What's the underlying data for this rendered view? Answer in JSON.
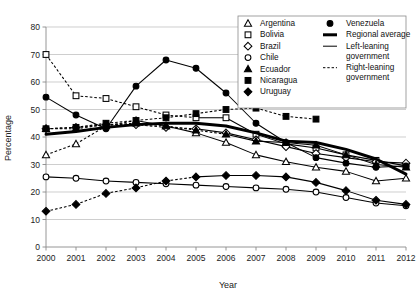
{
  "chart_data": {
    "type": "line",
    "title": "",
    "xlabel": "Year",
    "ylabel": "Percentage",
    "x": [
      2000,
      2001,
      2002,
      2003,
      2004,
      2005,
      2006,
      2007,
      2008,
      2009,
      2010,
      2011,
      2012
    ],
    "xlim": [
      2000,
      2012
    ],
    "ylim": [
      0,
      80
    ],
    "yticks": [
      0,
      10,
      20,
      30,
      40,
      50,
      60,
      70,
      80
    ],
    "xticks": [
      "2000",
      "2001",
      "2002",
      "2003",
      "2004",
      "2005",
      "2006",
      "2007",
      "2008",
      "2009",
      "2010",
      "2011",
      "2012"
    ],
    "grid": "horizontal",
    "legend_position": "top-right",
    "series": [
      {
        "name": "Argentina",
        "marker": "triangle-open",
        "linestyle": "mixed",
        "x": [
          2000,
          2001,
          2002,
          2003,
          2004,
          2005,
          2006,
          2007,
          2008,
          2009,
          2010,
          2011,
          2012
        ],
        "values": [
          33.5,
          37.5,
          44.0,
          46.0,
          44.0,
          41.5,
          38.0,
          33.5,
          31.0,
          29.0,
          27.5,
          24.0,
          25.0
        ]
      },
      {
        "name": "Bolivia",
        "marker": "square-open",
        "linestyle": "mixed",
        "x": [
          2000,
          2001,
          2002,
          2003,
          2004,
          2005,
          2006,
          2007,
          2008,
          2009,
          2010,
          2011,
          2012
        ],
        "values": [
          70.0,
          55.0,
          54.0,
          51.0,
          48.0,
          47.0,
          47.0,
          41.0,
          37.5,
          36.0,
          33.5,
          31.5,
          29.5
        ]
      },
      {
        "name": "Brazil",
        "marker": "diamond-open",
        "linestyle": "mixed",
        "x": [
          2000,
          2001,
          2002,
          2003,
          2004,
          2005,
          2006,
          2007,
          2008,
          2009,
          2010,
          2011,
          2012
        ],
        "values": [
          43.0,
          43.5,
          44.5,
          44.5,
          43.5,
          43.0,
          41.5,
          39.0,
          36.5,
          34.0,
          32.5,
          31.0,
          30.5
        ]
      },
      {
        "name": "Chile",
        "marker": "circle-open",
        "linestyle": "solid",
        "x": [
          2000,
          2001,
          2002,
          2003,
          2004,
          2005,
          2006,
          2007,
          2008,
          2009,
          2010,
          2011,
          2012
        ],
        "values": [
          25.5,
          25.0,
          24.0,
          23.5,
          23.0,
          22.5,
          22.0,
          21.5,
          21.0,
          20.0,
          18.0,
          16.0,
          15.0
        ]
      },
      {
        "name": "Ecuador",
        "marker": "triangle-filled",
        "linestyle": "mixed",
        "x": [
          2000,
          2001,
          2002,
          2003,
          2004,
          2005,
          2006,
          2007,
          2008,
          2009,
          2010,
          2011,
          2012
        ],
        "values": [
          43.0,
          43.0,
          44.5,
          45.0,
          44.0,
          42.5,
          41.0,
          38.5,
          38.0,
          37.0,
          33.5,
          30.0,
          29.0
        ]
      },
      {
        "name": "Nicaragua",
        "marker": "square-filled",
        "linestyle": "dashed",
        "x": [
          2000,
          2001,
          2002,
          2003,
          2004,
          2005,
          2006,
          2007,
          2008,
          2009
        ],
        "values": [
          43.0,
          43.5,
          45.0,
          46.0,
          47.0,
          48.5,
          50.0,
          50.5,
          47.5,
          46.5
        ]
      },
      {
        "name": "Uruguay",
        "marker": "diamond-filled",
        "linestyle": "mixed",
        "x": [
          2000,
          2001,
          2002,
          2003,
          2004,
          2005,
          2006,
          2007,
          2008,
          2009,
          2010,
          2011,
          2012
        ],
        "values": [
          13.0,
          15.5,
          19.5,
          21.5,
          24.0,
          25.5,
          26.0,
          26.0,
          25.5,
          23.5,
          20.5,
          17.0,
          15.5
        ]
      },
      {
        "name": "Venezuela",
        "marker": "circle-filled",
        "linestyle": "solid",
        "x": [
          2000,
          2001,
          2002,
          2003,
          2004,
          2005,
          2006,
          2007,
          2008,
          2009,
          2010,
          2011,
          2012
        ],
        "values": [
          54.5,
          48.0,
          43.0,
          58.5,
          68.0,
          65.0,
          56.0,
          45.0,
          38.0,
          32.5,
          30.5,
          29.0,
          29.5
        ]
      },
      {
        "name": "Regional average",
        "marker": "none",
        "linestyle": "thick",
        "x": [
          2000,
          2001,
          2002,
          2003,
          2004,
          2005,
          2006,
          2007,
          2008,
          2009,
          2010,
          2011,
          2012
        ],
        "values": [
          41.0,
          42.0,
          43.5,
          44.5,
          45.0,
          45.0,
          44.0,
          41.5,
          38.5,
          38.0,
          35.5,
          32.0,
          26.5
        ]
      }
    ]
  },
  "axes": {
    "y_title": "Percentage",
    "x_title": "Year"
  },
  "legend": {
    "column1": [
      {
        "label": "Argentina",
        "marker": "triangle-open",
        "icon": "triangle-open-icon"
      },
      {
        "label": "Bolivia",
        "marker": "square-open",
        "icon": "square-open-icon"
      },
      {
        "label": "Brazil",
        "marker": "diamond-open",
        "icon": "diamond-open-icon"
      },
      {
        "label": "Chile",
        "marker": "circle-open",
        "icon": "circle-open-icon"
      },
      {
        "label": "Ecuador",
        "marker": "triangle-filled",
        "icon": "triangle-filled-icon"
      },
      {
        "label": "Nicaragua",
        "marker": "square-filled",
        "icon": "square-filled-icon"
      },
      {
        "label": "Uruguay",
        "marker": "diamond-filled",
        "icon": "diamond-filled-icon"
      }
    ],
    "column2": [
      {
        "label": "Venezuela",
        "marker": "circle-filled",
        "icon": "circle-filled-icon"
      },
      {
        "label": "Regional average",
        "marker": "thick-line",
        "icon": "thick-line-icon"
      },
      {
        "label": "Left-leaning government",
        "line1": "Left-leaning",
        "line2": "government",
        "marker": "thin-line",
        "icon": "thin-line-icon"
      },
      {
        "label": "Right-leaning government",
        "line1": "Right-leaning",
        "line2": "government",
        "marker": "dashed-line",
        "icon": "dashed-line-icon"
      }
    ]
  },
  "colors": {
    "ink": "#000000",
    "grid": "#b9b9b9",
    "axis": "#8a8a8a",
    "background": "#ffffff"
  }
}
